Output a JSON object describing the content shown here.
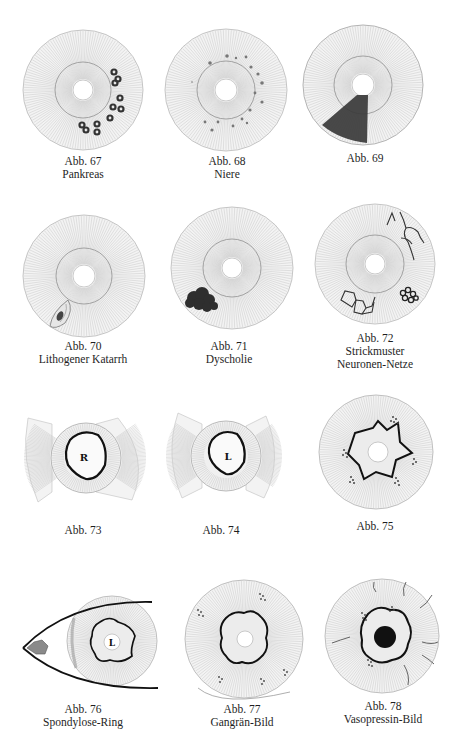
{
  "page": {
    "type": "iridology plate",
    "background": "#ffffff"
  },
  "figures": [
    {
      "number": "Abb. 67",
      "title": "Pankreas",
      "feature": "dark ring-shaped spots right-lower iris"
    },
    {
      "number": "Abb. 68",
      "title": "Niere",
      "feature": "small dots around inner ring"
    },
    {
      "number": "Abb. 69",
      "title": "",
      "feature": "dark wedge sector lower-left"
    },
    {
      "number": "Abb. 70",
      "title": "Lithogener Katarrh",
      "feature": "spindle-shaped lesion lower-left edge"
    },
    {
      "number": "Abb. 71",
      "title": "Dyscholie",
      "feature": "dark cloudy blot lower-left"
    },
    {
      "number": "Abb. 72",
      "title": "Strickmuster",
      "title2": "Neuronen-Netze",
      "feature": "branching lines and net patterns"
    },
    {
      "number": "Abb. 73",
      "title": "",
      "feature": "bow-tie sector, heavy collarette",
      "letter": "R"
    },
    {
      "number": "Abb. 74",
      "title": "",
      "feature": "bow-tie sector, heavy collarette",
      "letter": "L"
    },
    {
      "number": "Abb. 75",
      "title": "",
      "feature": "star-shaped collarette with dotted clusters"
    },
    {
      "number": "Abb. 76",
      "title": "Spondylose-Ring",
      "feature": "eye outline with iris, caruncle",
      "letter": "L"
    },
    {
      "number": "Abb. 77",
      "title": "Gangrän-Bild",
      "feature": "wavy collarette, dotted clusters, rim arc"
    },
    {
      "number": "Abb. 78",
      "title": "Vasopressin-Bild",
      "feature": "black pupil, vessels, dotted clusters"
    }
  ],
  "colors": {
    "ink": "#1a1a1a",
    "ray": "#c8c8c8",
    "iris_fill": "#f2f2f2",
    "dark_shade": "#3a3a3a",
    "caruncle": "#8a8a8a"
  }
}
